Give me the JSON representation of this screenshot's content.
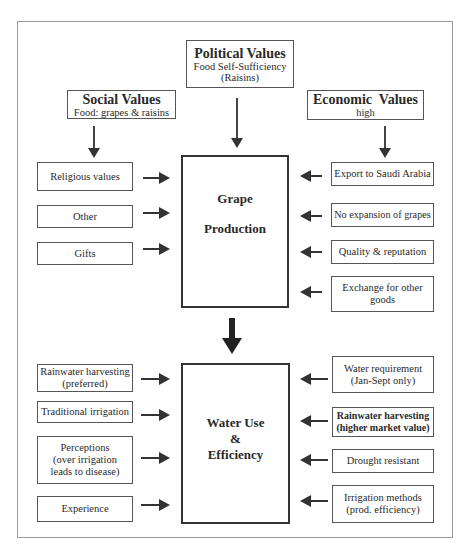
{
  "diagram": {
    "top_values": {
      "political": {
        "title": "Political Values",
        "line1": "Food Self-Sufficiency",
        "line2": "(Raisins)"
      },
      "social": {
        "title": "Social Values",
        "line1": "Food: grapes & raisins"
      },
      "economic": {
        "title": "Economic  Values",
        "line1": "high"
      }
    },
    "grape_production": {
      "line1": "Grape",
      "line2": "Production"
    },
    "grape_left_inputs": [
      {
        "label": "Religious values"
      },
      {
        "label": "Other"
      },
      {
        "label": "Gifts"
      }
    ],
    "grape_right_inputs": [
      {
        "label": "Export to Saudi Arabia"
      },
      {
        "label": "No expansion of grapes"
      },
      {
        "label": "Quality & reputation"
      },
      {
        "line1": "Exchange for other",
        "line2": "goods"
      }
    ],
    "water_use": {
      "line1": "Water Use",
      "line2": "&",
      "line3": "Efficiency"
    },
    "water_left_inputs": [
      {
        "line1": "Rainwater harvesting",
        "line2": "(preferred)"
      },
      {
        "label": "Traditional irrigation"
      },
      {
        "line1": "Perceptions",
        "line2": "(over irrigation",
        "line3": "leads to disease)"
      },
      {
        "label": "Experience"
      }
    ],
    "water_right_inputs": [
      {
        "line1": "Water requirement",
        "line2": "(Jan-Sept only)"
      },
      {
        "line1": "Rainwater harvesting",
        "line2": "(higher market value)",
        "bold": true
      },
      {
        "label": "Drought resistant"
      },
      {
        "line1": "Irrigation methods",
        "line2": "(prod. efficiency)"
      }
    ]
  }
}
